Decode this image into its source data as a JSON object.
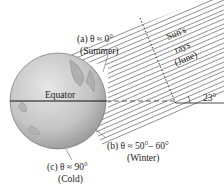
{
  "diagram": {
    "labels": {
      "equator": "Equator",
      "sun_rays": [
        "Sun's",
        "rays",
        "(June)"
      ],
      "tilt_angle": "23°",
      "a": {
        "line1": "(a)  θ ≈ 0°",
        "line2": "(Summer)"
      },
      "b": {
        "line1": "(b)  θ ≈ 50°– 60°",
        "line2": "(Winter)"
      },
      "c": {
        "line1": "(c)  θ ≈ 90°",
        "line2": "(Cold)"
      }
    },
    "colors": {
      "globe": "#c8c8c8",
      "globe_shadow": "#9a9a9a",
      "rays": "#444444",
      "text": "#222222"
    }
  }
}
